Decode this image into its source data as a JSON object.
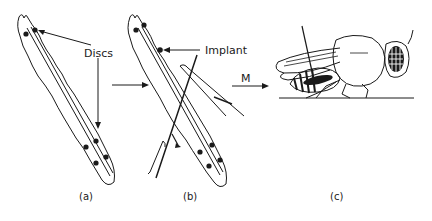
{
  "figure": {
    "colors": {
      "ink": "#1a1a1a",
      "background": "#ffffff"
    },
    "panels": [
      {
        "id": "a",
        "caption": "(a)",
        "subject": "larva",
        "annotation": "Discs"
      },
      {
        "id": "b",
        "caption": "(b)",
        "subject": "larva with implant being inserted by needle",
        "annotation": "Implant"
      },
      {
        "id": "c",
        "caption": "(c)",
        "subject": "adult fly with implant in abdomen"
      }
    ],
    "arrows": [
      {
        "from": "a",
        "to": "b",
        "label": ""
      },
      {
        "from": "b",
        "to": "c",
        "label": "M"
      }
    ]
  }
}
